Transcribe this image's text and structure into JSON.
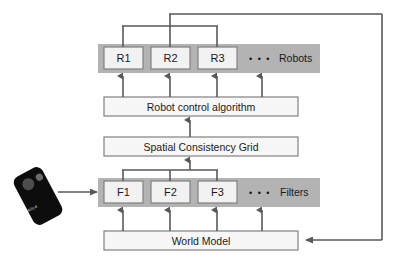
{
  "diagram": {
    "background_color": "#ffffff",
    "band_color": "#b3b3b3",
    "box_fill": "#f2f2f2",
    "box_border": "#808080",
    "line_color": "#595959",
    "text_color": "#1a1a1a",
    "bands": [
      {
        "id": "robots",
        "label": "Robots"
      },
      {
        "id": "filters",
        "label": "Filters"
      }
    ],
    "robot_nodes": [
      {
        "id": "r1",
        "label": "R1"
      },
      {
        "id": "r2",
        "label": "R2"
      },
      {
        "id": "r3",
        "label": "R3"
      }
    ],
    "filter_nodes": [
      {
        "id": "f1",
        "label": "F1"
      },
      {
        "id": "f2",
        "label": "F2"
      },
      {
        "id": "f3",
        "label": "F3"
      }
    ],
    "ellipsis": "• • •",
    "process_boxes": [
      {
        "id": "robot-control-algorithm",
        "label": "Robot control algorithm"
      },
      {
        "id": "spatial-consistency-grid",
        "label": "Spatial Consistency Grid"
      },
      {
        "id": "world-model",
        "label": "World Model"
      }
    ],
    "device": {
      "id": "handheld-device",
      "brand_text": "Alice",
      "body_color": "#0d0d0d",
      "button_color": "#4d4d4d"
    }
  }
}
